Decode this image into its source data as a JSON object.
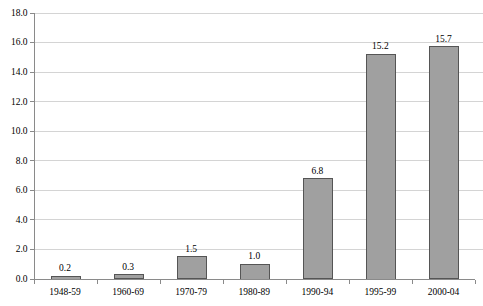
{
  "chart_data": {
    "type": "bar",
    "title": "",
    "subtitle": "",
    "xlabel": "",
    "ylabel": "",
    "categories": [
      "1948-59",
      "1960-69",
      "1970-79",
      "1980-89",
      "1990-94",
      "1995-99",
      "2000-04"
    ],
    "values": [
      0.2,
      0.3,
      1.5,
      1.0,
      6.8,
      15.2,
      15.7
    ],
    "value_labels": [
      "0.2",
      "0.3",
      "1.5",
      "1.0",
      "6.8",
      "15.2",
      "15.7"
    ],
    "ylim": [
      0.0,
      18.0
    ],
    "ytick_values": [
      0.0,
      2.0,
      4.0,
      6.0,
      8.0,
      10.0,
      12.0,
      14.0,
      16.0,
      18.0
    ],
    "ytick_labels": [
      "0.0",
      "2.0",
      "4.0",
      "6.0",
      "8.0",
      "10.0",
      "12.0",
      "14.0",
      "16.0",
      "18.0"
    ],
    "grid": true,
    "grid_axis": "y",
    "legend": false,
    "legend_position": "none",
    "series": [
      {
        "name": "",
        "values": [
          0.2,
          0.3,
          1.5,
          1.0,
          6.8,
          15.2,
          15.7
        ]
      }
    ]
  },
  "style": {
    "bar_fill": "#a0a0a0",
    "bar_border": "#555555",
    "gridline_color": "#d4d4d4",
    "axis_color": "#8a8a8a",
    "text_color": "#000000",
    "background": "#ffffff"
  }
}
